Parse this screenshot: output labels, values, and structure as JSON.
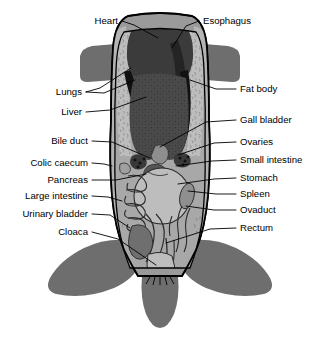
{
  "figure": {
    "view": "ventral-dissection"
  },
  "palette": {
    "background": "#ffffff",
    "limb_gray": "#6e6e6e",
    "body_wall_gray": "#8c8c8c",
    "fat_body_light": "#b9b9b9",
    "cavity_light": "#a8a8a8",
    "organ_light": "#b5b5b5",
    "organ_mid": "#8a8a8a",
    "heart_dark": "#3b3b3b",
    "liver_dark": "#4a4a4a",
    "lung_black": "#151515",
    "outline": "#000000",
    "label_text": "#000000"
  },
  "labels_left": [
    {
      "id": "heart",
      "text": "Heart",
      "text_x": 118,
      "text_y": 21,
      "leaders": [
        "M122,21 L134,25 L158,38"
      ]
    },
    {
      "id": "lungs",
      "text": "Lungs",
      "text_x": 82,
      "text_y": 92,
      "leaders": [
        "M86,92 L100,88 L131,68",
        "M86,92 L104,93 L135,80"
      ]
    },
    {
      "id": "liver",
      "text": "Liver",
      "text_x": 82,
      "text_y": 112,
      "leaders": [
        "M86,112 L110,110 L146,97"
      ]
    },
    {
      "id": "bile-duct",
      "text": "Bile duct",
      "text_x": 88,
      "text_y": 141,
      "leaders": [
        "M92,141 L112,142 L150,158"
      ]
    },
    {
      "id": "colic-caecum",
      "text": "Colic caecum",
      "text_x": 88,
      "text_y": 163,
      "leaders": [
        "M92,163 L104,164 L112,166"
      ]
    },
    {
      "id": "pancreas",
      "text": "Pancreas",
      "text_x": 88,
      "text_y": 180,
      "leaders": [
        "M92,180 L116,180 L146,174"
      ]
    },
    {
      "id": "large-intestine",
      "text": "Large intestine",
      "text_x": 88,
      "text_y": 196,
      "leaders": [
        "M92,196 L108,197 L122,201"
      ]
    },
    {
      "id": "urinary-bladder",
      "text": "Urinary bladder",
      "text_x": 88,
      "text_y": 214,
      "leaders": [
        "M92,214 L110,215 L130,228"
      ]
    },
    {
      "id": "cloaca",
      "text": "Cloaca",
      "text_x": 88,
      "text_y": 232,
      "leaders": [
        "M92,232 L118,239 L156,265"
      ]
    }
  ],
  "labels_right": [
    {
      "id": "esophagus",
      "text": "Esophagus",
      "text_x": 203,
      "text_y": 21,
      "leaders": [
        "M199,21 L186,26 L172,48"
      ]
    },
    {
      "id": "fat-body",
      "text": "Fat body",
      "text_x": 240,
      "text_y": 89,
      "leaders": [
        "M236,89 L216,89 L190,80"
      ]
    },
    {
      "id": "gall-bladder",
      "text": "Gall bladder",
      "text_x": 240,
      "text_y": 120,
      "leaders": [
        "M236,120 L206,122 L160,147"
      ]
    },
    {
      "id": "ovaries",
      "text": "Ovaries",
      "text_x": 240,
      "text_y": 142,
      "leaders": [
        "M236,142 L214,143 L178,155"
      ]
    },
    {
      "id": "small-intestine",
      "text": "Small intestine",
      "text_x": 240,
      "text_y": 160,
      "leaders": [
        "M236,160 L212,161 L176,166"
      ]
    },
    {
      "id": "stomach",
      "text": "Stomach",
      "text_x": 240,
      "text_y": 178,
      "leaders": [
        "M236,178 L214,179 L178,184"
      ]
    },
    {
      "id": "spleen",
      "text": "Spleen",
      "text_x": 240,
      "text_y": 194,
      "leaders": [
        "M236,194 L216,194 L188,191"
      ]
    },
    {
      "id": "ovaduct",
      "text": "Ovaduct",
      "text_x": 240,
      "text_y": 210,
      "leaders": [
        "M236,210 L214,210 L186,206"
      ]
    },
    {
      "id": "rectum",
      "text": "Rectum",
      "text_x": 240,
      "text_y": 228,
      "leaders": [
        "M236,228 L210,229 L166,243"
      ]
    }
  ]
}
